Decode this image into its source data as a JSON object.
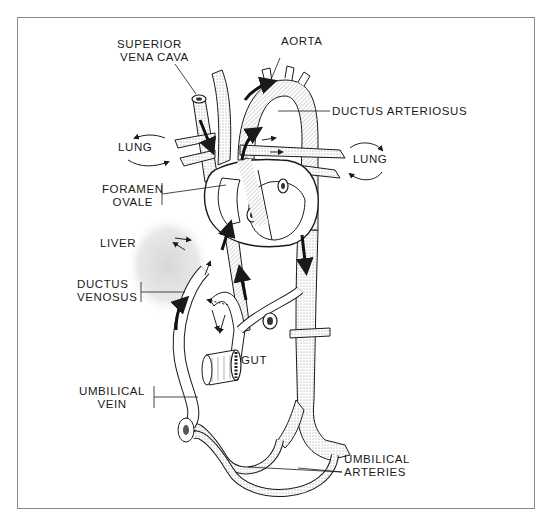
{
  "diagram": {
    "labels": {
      "superior_vena_cava_1": "SUPERIOR",
      "superior_vena_cava_2": "VENA CAVA",
      "aorta": "AORTA",
      "ductus_arteriosus": "DUCTUS ARTERIOSUS",
      "lung_left": "LUNG",
      "lung_right": "LUNG",
      "foramen_ovale_1": "FORAMEN",
      "foramen_ovale_2": "OVALE",
      "liver": "LIVER",
      "ductus_venosus_1": "DUCTUS",
      "ductus_venosus_2": "VENOSUS",
      "gut": "GUT",
      "umbilical_vein_1": "UMBILICAL",
      "umbilical_vein_2": "VEIN",
      "umbilical_arteries_1": "UMBILICAL",
      "umbilical_arteries_2": "ARTERIES"
    },
    "colors": {
      "line": "#1a1a1a",
      "frame": "#8a8a8a",
      "stipple": "#cfcfcf",
      "background": "#ffffff"
    }
  }
}
